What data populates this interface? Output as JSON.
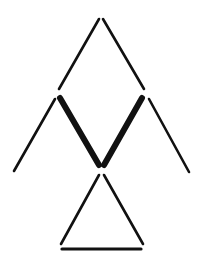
{
  "figure": {
    "background": "#ffffff",
    "stroke_color": "#111111",
    "segments": [
      {
        "id": "upper-left",
        "x1": 99,
        "y1": 19,
        "x2": 59,
        "y2": 89,
        "width": 2.6
      },
      {
        "id": "upper-right",
        "x1": 103,
        "y1": 19,
        "x2": 144,
        "y2": 89,
        "width": 2.6
      },
      {
        "id": "outer-left",
        "x1": 55,
        "y1": 99,
        "x2": 14,
        "y2": 171,
        "width": 2.6
      },
      {
        "id": "thick-left",
        "x1": 60,
        "y1": 98,
        "x2": 99,
        "y2": 165,
        "width": 6
      },
      {
        "id": "thick-right",
        "x1": 142,
        "y1": 98,
        "x2": 104,
        "y2": 165,
        "width": 6
      },
      {
        "id": "outer-right",
        "x1": 149,
        "y1": 99,
        "x2": 189,
        "y2": 172,
        "width": 2.6
      },
      {
        "id": "lower-left",
        "x1": 99,
        "y1": 175,
        "x2": 61,
        "y2": 244,
        "width": 2.6
      },
      {
        "id": "lower-right",
        "x1": 104,
        "y1": 175,
        "x2": 143,
        "y2": 244,
        "width": 2.6
      },
      {
        "id": "base",
        "x1": 62,
        "y1": 249,
        "x2": 141,
        "y2": 249,
        "width": 3.2
      }
    ]
  }
}
